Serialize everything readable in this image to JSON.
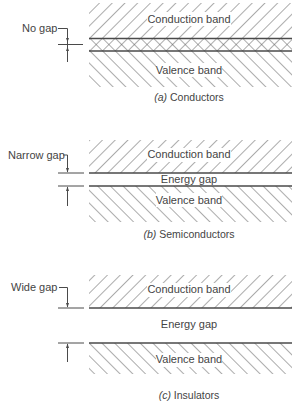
{
  "diagram": {
    "panels": [
      {
        "id": "a",
        "caption_letter": "(a)",
        "caption_text": " Conductors",
        "gap_label": "No gap",
        "conduction_label": "Conduction band",
        "valence_label": "Valence band",
        "energy_gap_label": ""
      },
      {
        "id": "b",
        "caption_letter": "(b)",
        "caption_text": " Semiconductors",
        "gap_label": "Narrow gap",
        "conduction_label": "Conduction band",
        "valence_label": "Valence band",
        "energy_gap_label": "Energy gap"
      },
      {
        "id": "c",
        "caption_letter": "(c)",
        "caption_text": " Insulators",
        "gap_label": "Wide gap",
        "conduction_label": "Conduction band",
        "valence_label": "Valence band",
        "energy_gap_label": "Energy gap"
      }
    ],
    "colors": {
      "line": "#4a4a4a",
      "hatch": "#5a5a5a",
      "text": "#444444",
      "background": "#ffffff"
    }
  }
}
